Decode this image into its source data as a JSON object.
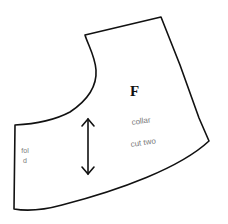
{
  "diagram": {
    "type": "sewing-pattern-piece",
    "piece_letter": "F",
    "piece_name": "collar",
    "cut_instruction": "cut two",
    "fold_label": "fold",
    "grainline": "double-headed vertical arrow",
    "colors": {
      "outline": "#111111",
      "label_text": "#7a7a7a",
      "background": "#ffffff"
    }
  }
}
